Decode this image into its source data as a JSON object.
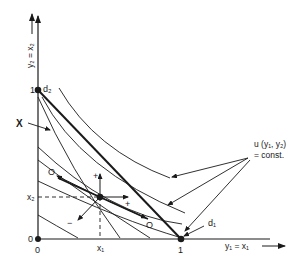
{
  "diagram": {
    "type": "economics-indifference-curves",
    "axes": {
      "x_label": "y₁ = x₁",
      "y_label": "y₂ = x₂",
      "x_tick_one": "1",
      "y_tick_one": "1",
      "origin_x_label": "0",
      "origin_y_label": "0"
    },
    "points": {
      "d1": "d₁",
      "d2": "d₂",
      "x1": "x₁",
      "x2": "x₂"
    },
    "annotations": {
      "set_label": "X",
      "utility_line1": "u (y₁, y₂)",
      "utility_line2": "= const.",
      "direction_O_left": "O",
      "direction_O_right": "O",
      "plus_up": "+",
      "plus_right": "+",
      "minus": "−"
    },
    "colors": {
      "ink": "#1a1a1a",
      "background": "#ffffff"
    }
  }
}
